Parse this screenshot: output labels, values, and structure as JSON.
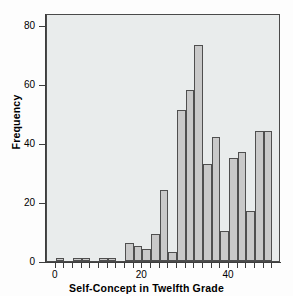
{
  "chart_data": {
    "type": "bar",
    "title": "",
    "subtitle": "",
    "xlabel": "Self-Concept in Twelfth Grade",
    "ylabel": "Frequency",
    "xlim": [
      -2,
      52
    ],
    "ylim": [
      0,
      84
    ],
    "grid": false,
    "legend": null,
    "bin_width": 2,
    "x_ticks": [
      {
        "value": 0,
        "label": "0"
      },
      {
        "value": 20,
        "label": "20"
      },
      {
        "value": 40,
        "label": "40"
      }
    ],
    "y_ticks": [
      {
        "value": 0,
        "label": "0"
      },
      {
        "value": 20,
        "label": "20"
      },
      {
        "value": 40,
        "label": "40"
      },
      {
        "value": 60,
        "label": "60"
      },
      {
        "value": 80,
        "label": "80"
      }
    ],
    "bins": [
      {
        "x_start": 0,
        "x_end": 2,
        "value": 1
      },
      {
        "x_start": 4,
        "x_end": 6,
        "value": 1
      },
      {
        "x_start": 6,
        "x_end": 8,
        "value": 1
      },
      {
        "x_start": 10,
        "x_end": 12,
        "value": 1
      },
      {
        "x_start": 12,
        "x_end": 14,
        "value": 1
      },
      {
        "x_start": 16,
        "x_end": 18,
        "value": 6
      },
      {
        "x_start": 18,
        "x_end": 20,
        "value": 5
      },
      {
        "x_start": 20,
        "x_end": 22,
        "value": 4
      },
      {
        "x_start": 22,
        "x_end": 24,
        "value": 9
      },
      {
        "x_start": 24,
        "x_end": 26,
        "value": 24
      },
      {
        "x_start": 26,
        "x_end": 28,
        "value": 3
      },
      {
        "x_start": 28,
        "x_end": 30,
        "value": 51
      },
      {
        "x_start": 30,
        "x_end": 32,
        "value": 58
      },
      {
        "x_start": 32,
        "x_end": 34,
        "value": 73
      },
      {
        "x_start": 34,
        "x_end": 36,
        "value": 33
      },
      {
        "x_start": 36,
        "x_end": 38,
        "value": 42
      },
      {
        "x_start": 38,
        "x_end": 40,
        "value": 10
      },
      {
        "x_start": 40,
        "x_end": 42,
        "value": 35
      },
      {
        "x_start": 42,
        "x_end": 44,
        "value": 37
      },
      {
        "x_start": 44,
        "x_end": 46,
        "value": 17
      },
      {
        "x_start": 46,
        "x_end": 48,
        "value": 44
      },
      {
        "x_start": 48,
        "x_end": 50,
        "value": 44
      }
    ],
    "colors": {
      "bar_fill": "#c9c9c9",
      "bar_edge": "#4f4f4f",
      "plot_background": "#e9ecec",
      "axis": "#3d3d3d",
      "figure_background": "#fdfdfd"
    }
  }
}
